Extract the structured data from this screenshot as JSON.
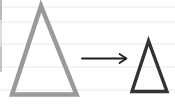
{
  "canvas": {
    "background": "#ffffff",
    "ruled_lines": {
      "color": "#e9e9e9",
      "y": [
        7,
        22,
        44,
        67,
        90
      ]
    },
    "left_edge_segments": [
      {
        "y1": 0,
        "y2": 20,
        "color": "#9c9c9c"
      },
      {
        "y1": 20,
        "y2": 47,
        "color": "#cdcdcd"
      },
      {
        "y1": 47,
        "y2": 72,
        "color": "#ababab"
      }
    ]
  },
  "diagram": {
    "large_triangle": {
      "shape": "triangle-outline",
      "points": "41,6 12,94.5 76.5,94.5",
      "stroke": "#9a9a9a",
      "stroke_width": 4.5
    },
    "arrow": {
      "shape": "right-arrow",
      "x1": 82,
      "y1": 58.5,
      "x2": 125,
      "y2": 58.5,
      "head_points": "119.5,54 126.5,58.5 119.5,63",
      "color": "#1f1f1f",
      "stroke_width": 1.8
    },
    "small_triangle": {
      "shape": "triangle-outline",
      "points": "148.5,41 132,91.5 167,91.5",
      "stroke": "#333333",
      "stroke_width": 3.4
    }
  }
}
